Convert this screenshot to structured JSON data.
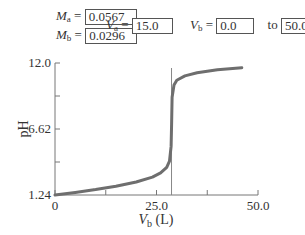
{
  "controls": {
    "ma": {
      "label": "M",
      "sub": "a",
      "eq": "=",
      "value": "0.0567"
    },
    "mb": {
      "label": "M",
      "sub": "b",
      "eq": "=",
      "value": "0.0296"
    },
    "va": {
      "label": "V",
      "sub": "a",
      "eq": "=",
      "value": "15.0"
    },
    "vb": {
      "label": "V",
      "sub": "b",
      "eq": "=",
      "value": "0.0"
    },
    "to_label": "to",
    "vb_max": "50.0"
  },
  "colors": {
    "curve": "#6e6e6e",
    "axis": "#777777",
    "equivalence_line": "#888888"
  },
  "chart_data": {
    "type": "line",
    "title": "",
    "xlabel": "Vb (L)",
    "xlabel_main": "V",
    "xlabel_sub": "b",
    "xlabel_unit": "(L)",
    "ylabel": "pH",
    "xlim": [
      0,
      50
    ],
    "ylim": [
      1.24,
      12.0
    ],
    "x_ticks": [
      0,
      12.5,
      25.0,
      37.5,
      50.0
    ],
    "x_tick_labels": [
      "0",
      "",
      "25.0",
      "",
      "50.0"
    ],
    "y_ticks": [
      1.24,
      3.93,
      6.62,
      9.31,
      12.0
    ],
    "y_tick_labels": [
      "1.24",
      "",
      "6.62",
      "",
      "12.0"
    ],
    "grid": false,
    "equivalence_volume": 28.7,
    "series": [
      {
        "name": "pH",
        "x": [
          0,
          5,
          10,
          15,
          20,
          24,
          26,
          27.5,
          28.2,
          28.6,
          28.73,
          28.85,
          29.3,
          30,
          32,
          35,
          40,
          46
        ],
        "y": [
          1.24,
          1.45,
          1.68,
          1.95,
          2.3,
          2.7,
          3.05,
          3.5,
          4.0,
          5.2,
          7.0,
          9.2,
          10.2,
          10.6,
          10.95,
          11.2,
          11.45,
          11.62
        ]
      }
    ]
  }
}
